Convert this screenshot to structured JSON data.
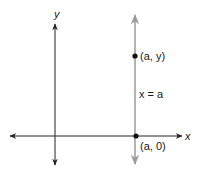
{
  "diagram": {
    "axes": {
      "x_label": "x",
      "y_label": "y",
      "axis_color": "#222222"
    },
    "vertical_line": {
      "label": "x = a",
      "color": "#9a9a9a"
    },
    "points": [
      {
        "label": "(a, y)"
      },
      {
        "label": "(a, 0)"
      }
    ]
  }
}
